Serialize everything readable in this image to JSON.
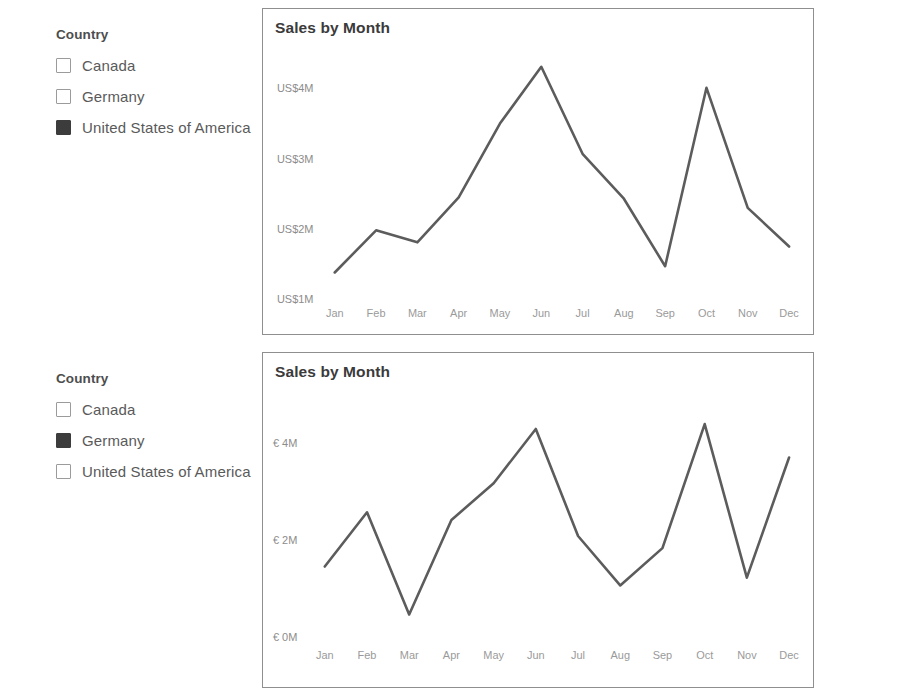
{
  "report": {
    "rows": [
      {
        "slicer": {
          "title": "Country",
          "expand_icon": "chevron-down-icon",
          "items": [
            {
              "label": "Canada",
              "checked": false
            },
            {
              "label": "Germany",
              "checked": false
            },
            {
              "label": "United States of America",
              "checked": true
            }
          ]
        },
        "chart": {
          "title": "Sales by Month"
        }
      },
      {
        "slicer": {
          "title": "Country",
          "expand_icon": "chevron-down-icon",
          "items": [
            {
              "label": "Canada",
              "checked": false
            },
            {
              "label": "Germany",
              "checked": true
            },
            {
              "label": "United States of America",
              "checked": false
            }
          ]
        },
        "chart": {
          "title": "Sales by Month"
        }
      }
    ]
  },
  "colors": {
    "line": "#5c5c5c",
    "checkbox_checked": "#3c3c3c",
    "checkbox_border": "#9b9b9b",
    "card_border": "#8f8f8f",
    "tick_text": "#9a9a9a",
    "title_text": "#3b3b3b"
  },
  "chart_data": [
    {
      "type": "line",
      "title": "Sales by Month",
      "xlabel": "",
      "ylabel": "",
      "categories": [
        "Jan",
        "Feb",
        "Mar",
        "Apr",
        "May",
        "Jun",
        "Jul",
        "Aug",
        "Sep",
        "Oct",
        "Nov",
        "Dec"
      ],
      "values": [
        1.38,
        1.98,
        1.81,
        2.45,
        3.5,
        4.31,
        3.07,
        2.43,
        1.47,
        4.01,
        2.3,
        1.75
      ],
      "value_unit": "US$M",
      "currency_symbol": "US$",
      "ytick_labels": [
        "US$4M",
        "US$3M",
        "US$2M",
        "US$1M"
      ],
      "ytick_values": [
        4,
        3,
        2,
        1
      ],
      "ylim": [
        0.6,
        4.62
      ],
      "grid": false,
      "legend": false,
      "series_name": "United States of America"
    },
    {
      "type": "line",
      "title": "Sales by Month",
      "xlabel": "",
      "ylabel": "",
      "categories": [
        "Jan",
        "Feb",
        "Mar",
        "Apr",
        "May",
        "Jun",
        "Jul",
        "Aug",
        "Sep",
        "Oct",
        "Nov",
        "Dec"
      ],
      "values": [
        1.46,
        2.58,
        0.47,
        2.42,
        3.18,
        4.3,
        2.09,
        1.07,
        1.84,
        4.4,
        1.23,
        3.71
      ],
      "value_unit": "€M",
      "currency_symbol": "€",
      "ytick_labels": [
        "€ 4M",
        "€ 2M",
        "€ 0M"
      ],
      "ytick_values": [
        4,
        2,
        0
      ],
      "ylim": [
        0.0,
        4.62
      ],
      "grid": false,
      "legend": false,
      "series_name": "Germany"
    }
  ]
}
